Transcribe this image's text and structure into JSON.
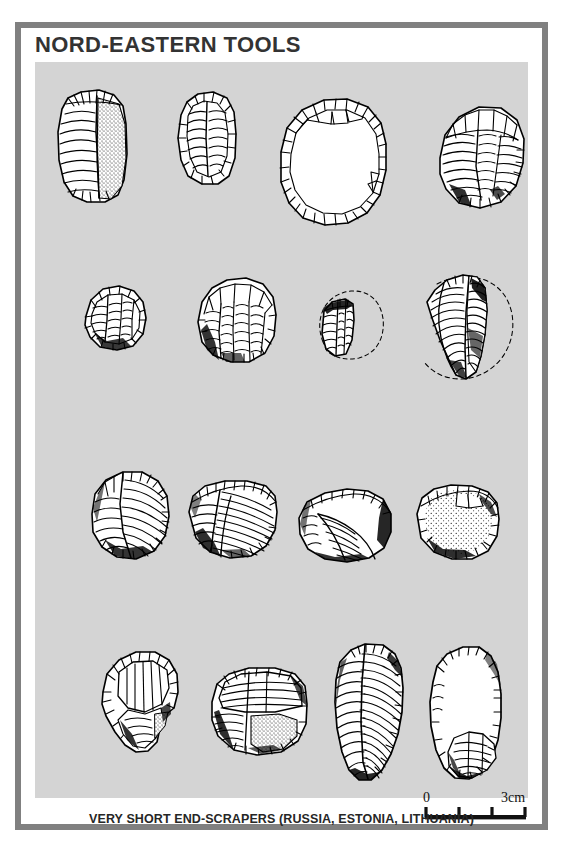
{
  "plate": {
    "title": "NORD-EASTERN TOOLS",
    "caption": "VERY SHORT END-SCRAPERS (RUSSIA, ESTONIA, LITHUANIA)",
    "figure_number": "",
    "frame_color": "#808080",
    "panel_color": "#d4d4d4",
    "page_color": "#ffffff",
    "ink_color": "#000000",
    "title_color": "#333333"
  },
  "scale": {
    "label_start": "0",
    "label_end": "3cm",
    "units": "cm",
    "ticks": [
      0,
      1,
      2,
      3
    ],
    "bar_length_px": 100
  },
  "figure": {
    "rows": 4,
    "artifact_count": 15,
    "artifacts": [
      {
        "id": 1,
        "row": 1,
        "col": 1,
        "name": "tall-rectangular-endscraper-with-cortex",
        "dashed_reconstruction": false
      },
      {
        "id": 2,
        "row": 1,
        "col": 2,
        "name": "oval-endscraper-steep-retouch",
        "dashed_reconstruction": false
      },
      {
        "id": 3,
        "row": 1,
        "col": 3,
        "name": "large-circular-scraper-plain-interior",
        "dashed_reconstruction": false
      },
      {
        "id": 4,
        "row": 1,
        "col": 4,
        "name": "round-scraper-radial-flaking",
        "dashed_reconstruction": false
      },
      {
        "id": 5,
        "row": 2,
        "col": 1,
        "name": "small-round-endscraper",
        "dashed_reconstruction": false
      },
      {
        "id": 6,
        "row": 2,
        "col": 2,
        "name": "subcircular-endscraper-broad-flakes",
        "dashed_reconstruction": false
      },
      {
        "id": 7,
        "row": 2,
        "col": 3,
        "name": "fragmentary-scraper-with-dashed-outline",
        "dashed_reconstruction": true
      },
      {
        "id": 8,
        "row": 2,
        "col": 4,
        "name": "crescent-fragment-with-dashed-outline",
        "dashed_reconstruction": true
      },
      {
        "id": 9,
        "row": 3,
        "col": 1,
        "name": "round-endscraper-curved-ridge",
        "dashed_reconstruction": false
      },
      {
        "id": 10,
        "row": 3,
        "col": 2,
        "name": "fan-shaped-endscraper-dense-hatching",
        "dashed_reconstruction": false
      },
      {
        "id": 11,
        "row": 3,
        "col": 3,
        "name": "wide-fan-endscraper-thin-section",
        "dashed_reconstruction": false
      },
      {
        "id": 12,
        "row": 3,
        "col": 4,
        "name": "stippled-cortex-endscraper",
        "dashed_reconstruction": false
      },
      {
        "id": 13,
        "row": 4,
        "col": 1,
        "name": "notched-endscraper-with-tang",
        "dashed_reconstruction": false
      },
      {
        "id": 14,
        "row": 4,
        "col": 2,
        "name": "squat-endscraper-stippled-base",
        "dashed_reconstruction": false
      },
      {
        "id": 15,
        "row": 4,
        "col": 3,
        "name": "elongated-blade-endscraper-pair",
        "dashed_reconstruction": false
      }
    ]
  }
}
